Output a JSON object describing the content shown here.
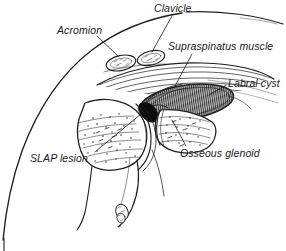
{
  "figure": {
    "background_color": "#ffffff",
    "ink_color": "#1a1a1a",
    "width": 286,
    "height": 251
  },
  "labels": {
    "clavicle": "Clavicle",
    "acromion": "Acromion",
    "supraspinatus": "Supraspinatus muscle",
    "labral_cyst": "Labral cyst",
    "slap_lesion": "SLAP lesion",
    "osseous_glenoid": "Osseous glenoid"
  },
  "structures": [
    {
      "name": "clavicle",
      "description": "small oval bone cross-section, superior"
    },
    {
      "name": "acromion",
      "description": "small oval bone cross-section, superior lateral"
    },
    {
      "name": "supraspinatus-muscle",
      "description": "striated muscle belly above joint"
    },
    {
      "name": "labral-cyst",
      "description": "elongated hatched ellipse, paralabral"
    },
    {
      "name": "slap-lesion",
      "description": "superior labrum anterior-posterior tear"
    },
    {
      "name": "osseous-glenoid",
      "description": "stippled glenoid bone"
    },
    {
      "name": "humeral-head",
      "description": "stippled rounded bone, lateral"
    },
    {
      "name": "body-contour",
      "description": "outer torso and shoulder outline arc"
    }
  ]
}
